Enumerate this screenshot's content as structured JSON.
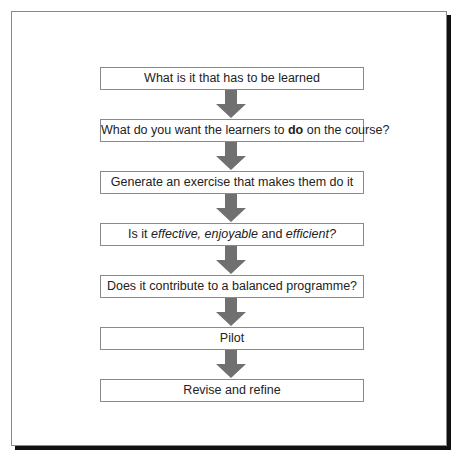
{
  "diagram": {
    "type": "vertical-flowchart",
    "colors": {
      "arrow": "#707070",
      "box_border": "#8a8a8a",
      "shadow": "#111111",
      "text": "#222222"
    },
    "steps": [
      {
        "parts": [
          {
            "text": "What is it that has to be learned",
            "style": "normal"
          }
        ]
      },
      {
        "parts": [
          {
            "text": "What do you want the learners to ",
            "style": "normal"
          },
          {
            "text": "do",
            "style": "bold"
          },
          {
            "text": " on the course?",
            "style": "normal"
          }
        ]
      },
      {
        "parts": [
          {
            "text": "Generate an exercise that makes them do it",
            "style": "normal"
          }
        ]
      },
      {
        "parts": [
          {
            "text": "Is it ",
            "style": "normal"
          },
          {
            "text": "effective, enjoyable",
            "style": "italic"
          },
          {
            "text": " and ",
            "style": "normal"
          },
          {
            "text": "efficient?",
            "style": "italic"
          }
        ]
      },
      {
        "parts": [
          {
            "text": "Does it contribute to a balanced programme?",
            "style": "normal"
          }
        ]
      },
      {
        "parts": [
          {
            "text": "Pilot",
            "style": "normal"
          }
        ]
      },
      {
        "parts": [
          {
            "text": "Revise and refine",
            "style": "normal"
          }
        ]
      }
    ],
    "arrow_icon": "down-arrow-icon"
  }
}
